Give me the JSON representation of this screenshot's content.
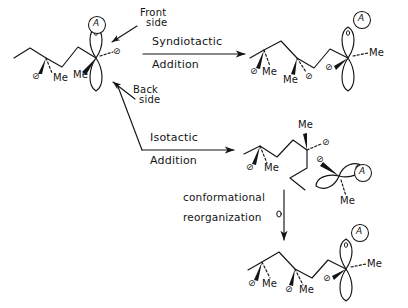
{
  "figure": {
    "background_color": "#ffffff",
    "ink_color": "#141414",
    "type": "reaction-scheme",
    "glyphs": {
      "substituent": "⊘",
      "methyl": "Me",
      "chain_end_label": "A",
      "chain_end_radical_mark": "'"
    }
  },
  "annotations": {
    "front_side": "Front\nside",
    "back_side": "Back\nside",
    "front_side_line1": "Front",
    "front_side_line2": "side",
    "back_side_line1": "Back",
    "back_side_line2": "side"
  },
  "arrows": {
    "syndiotactic": {
      "above": "Syndiotactic",
      "below": "Addition",
      "direction": "right"
    },
    "isotactic": {
      "above": "Isotactic",
      "below": "Addition",
      "direction": "right"
    },
    "conformational": {
      "line1": "conformational",
      "line2": "reorganization",
      "direction": "down"
    }
  },
  "structures": [
    {
      "id": "reactant",
      "name": "starting-chain",
      "orbital": "p-orbital-vertical",
      "chain_end": "A",
      "methyl_labels": [
        "Me",
        "Me"
      ],
      "substituent_labels": [
        "⊘",
        "⊘"
      ]
    },
    {
      "id": "syndiotactic-product",
      "name": "syndiotactic-chain",
      "orbital": "p-orbital-vertical",
      "chain_end": "A",
      "methyl_labels": [
        "Me",
        "Me",
        "Me"
      ],
      "substituent_labels": [
        "⊘",
        "⊘",
        "⊘"
      ]
    },
    {
      "id": "isotactic-product",
      "name": "isotactic-chain-coiled",
      "orbital": "p-orbital-tilted",
      "chain_end": "A",
      "methyl_labels": [
        "Me",
        "Me",
        "Me"
      ],
      "substituent_labels": [
        "⊘",
        "⊘",
        "⊘"
      ]
    },
    {
      "id": "isotactic-reorganized",
      "name": "isotactic-chain-extended",
      "orbital": "p-orbital-vertical",
      "chain_end": "A",
      "methyl_labels": [
        "Me",
        "Me",
        "Me"
      ],
      "substituent_labels": [
        "⊘",
        "⊘",
        "⊘"
      ]
    }
  ],
  "labels": {
    "reactant": {
      "me_left": "Me",
      "me_right": "Me",
      "sub_left": "⊘",
      "sub_right": "⊘",
      "a": "A"
    },
    "syndiotactic": {
      "me_1": "Me",
      "me_2": "Me",
      "me_3": "Me",
      "sub_1": "⊘",
      "sub_2": "⊘",
      "sub_3": "⊘",
      "a": "A"
    },
    "isotactic": {
      "me_1": "Me",
      "me_2": "Me",
      "me_3": "Me",
      "sub_1": "⊘",
      "sub_2": "⊘",
      "sub_3": "⊘",
      "a": "A"
    },
    "reorganized": {
      "me_1": "Me",
      "me_2": "Me",
      "me_3": "Me",
      "sub_1": "⊘",
      "sub_2": "⊘",
      "sub_3": "⊘",
      "a": "A"
    }
  }
}
